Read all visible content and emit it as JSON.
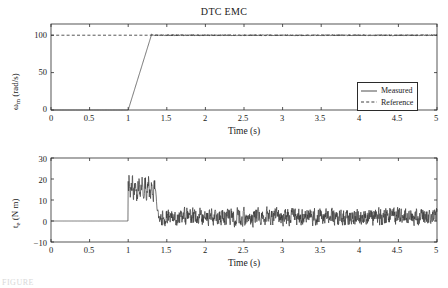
{
  "figure": {
    "title": "DTC EMC",
    "caption_fragment": "FIGURE"
  },
  "top_plot": {
    "title": "DTC EMC",
    "xlabel": "Time (s)",
    "ylabel_symbol": "ω",
    "ylabel_subscript": "m",
    "ylabel_units": " (rad/s)",
    "xticks": [
      "0",
      "0.5",
      "1",
      "1.5",
      "2",
      "2.5",
      "3",
      "3.5",
      "4",
      "4.5",
      "5"
    ],
    "yticks": [
      "0",
      "50",
      "100"
    ],
    "legend": [
      {
        "label": "Measured",
        "style": "solid"
      },
      {
        "label": "Reference",
        "style": "dashed"
      }
    ]
  },
  "bottom_plot": {
    "xlabel": "Time (s)",
    "ylabel_symbol": "t",
    "ylabel_subscript": "e",
    "ylabel_units": " (N m)",
    "xticks": [
      "0",
      "0.5",
      "1",
      "1.5",
      "2",
      "2.5",
      "3",
      "3.5",
      "4",
      "4.5",
      "5"
    ],
    "yticks": [
      "30",
      "20",
      "10",
      "0",
      "−10"
    ]
  },
  "colors": {
    "line": "#3a3a3a",
    "axis": "#2b2b2b",
    "background": "#ffffff"
  },
  "chart_data": [
    {
      "type": "line",
      "title": "DTC EMC",
      "xlabel": "Time (s)",
      "ylabel": "ω_m (rad/s)",
      "xlim": [
        0,
        5
      ],
      "ylim": [
        0,
        115
      ],
      "yticks": [
        0,
        50,
        100
      ],
      "xticks": [
        0,
        0.5,
        1,
        1.5,
        2,
        2.5,
        3,
        3.5,
        4,
        4.5,
        5
      ],
      "grid": false,
      "legend_position": "lower right",
      "series": [
        {
          "name": "Measured",
          "style": "solid",
          "description": "Zero until t=1 s, linear ramp to 100 rad/s by t=1.3 s with slight overshoot, then holds 100 rad/s with small ripple to t=5 s",
          "x": [
            0,
            0.25,
            0.5,
            0.75,
            1.0,
            1.05,
            1.1,
            1.15,
            1.2,
            1.25,
            1.3,
            1.35,
            1.4,
            1.6,
            1.8,
            2.0,
            2.25,
            2.5,
            2.75,
            3.0,
            3.25,
            3.5,
            3.75,
            4.0,
            4.25,
            4.5,
            4.75,
            5.0
          ],
          "y": [
            0,
            0,
            0,
            0,
            0,
            17,
            34,
            51,
            68,
            85,
            101,
            100.2,
            99.8,
            100.3,
            99.7,
            100.2,
            99.8,
            100.3,
            99.8,
            100.2,
            99.7,
            100.3,
            99.8,
            100.2,
            99.8,
            100.3,
            99.8,
            100.1
          ]
        },
        {
          "name": "Reference",
          "style": "dashed",
          "description": "Constant 100 rad/s across the whole time span",
          "x": [
            0,
            5
          ],
          "y": [
            100,
            100
          ]
        }
      ]
    },
    {
      "type": "line",
      "title": "",
      "xlabel": "Time (s)",
      "ylabel": "t_e (N m)",
      "xlim": [
        0,
        5
      ],
      "ylim": [
        -10,
        30
      ],
      "yticks": [
        -10,
        0,
        10,
        20,
        30
      ],
      "xticks": [
        0,
        0.5,
        1,
        1.5,
        2,
        2.5,
        3,
        3.5,
        4,
        4.5,
        5
      ],
      "grid": false,
      "legend_position": "none",
      "series": [
        {
          "name": "Electromagnetic torque",
          "style": "solid",
          "description": "Flat at 0 N m until t=1 s, then a noisy acceleration burst between 10 and 22 N m until about t=1.35 s, then settles to a noisy steady band roughly between -5 and +8 N m with mean near 2 N m",
          "segments": [
            {
              "phase": "pre-step",
              "t_range": [
                0,
                1.0
              ],
              "value": 0
            },
            {
              "phase": "acceleration-burst",
              "t_range": [
                1.0,
                1.35
              ],
              "min": 9,
              "max": 22,
              "mean": 15
            },
            {
              "phase": "steady-noise",
              "t_range": [
                1.35,
                5.0
              ],
              "min": -6,
              "max": 9,
              "mean": 2
            }
          ]
        }
      ]
    }
  ]
}
